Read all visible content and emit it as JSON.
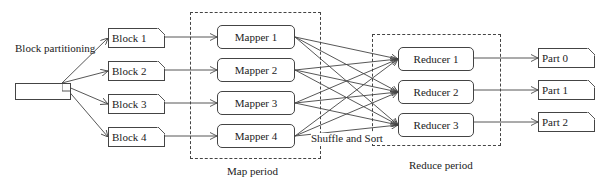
{
  "diagram": {
    "source_label": "",
    "partition_label": "Block partitioning",
    "blocks": [
      {
        "label": "Block 1"
      },
      {
        "label": "Block 2"
      },
      {
        "label": "Block 3"
      },
      {
        "label": "Block 4"
      }
    ],
    "mappers": [
      {
        "label": "Mapper 1"
      },
      {
        "label": "Mapper 2"
      },
      {
        "label": "Mapper 3"
      },
      {
        "label": "Mapper 4"
      }
    ],
    "reducers": [
      {
        "label": "Reducer 1"
      },
      {
        "label": "Reducer 2"
      },
      {
        "label": "Reducer 3"
      }
    ],
    "parts": [
      {
        "label": "Part 0"
      },
      {
        "label": "Part 1"
      },
      {
        "label": "Part 2"
      }
    ],
    "groups": {
      "map": {
        "label": "Map period"
      },
      "reduce": {
        "label": "Reduce period"
      },
      "shuffle": {
        "label": "Shuffle and Sort"
      }
    },
    "edges": {
      "source_to_blocks": [
        "Block 1",
        "Block 2",
        "Block 3",
        "Block 4"
      ],
      "blocks_to_mappers": [
        [
          "Block 1",
          "Mapper 1"
        ],
        [
          "Block 2",
          "Mapper 2"
        ],
        [
          "Block 3",
          "Mapper 3"
        ],
        [
          "Block 4",
          "Mapper 4"
        ]
      ],
      "mappers_to_reducers": "all-to-all",
      "reducers_to_parts": [
        [
          "Reducer 1",
          "Part 0"
        ],
        [
          "Reducer 2",
          "Part 1"
        ],
        [
          "Reducer 3",
          "Part 2"
        ]
      ]
    },
    "colors": {
      "stroke": "#444444",
      "text": "#222222",
      "background": "#ffffff"
    }
  }
}
